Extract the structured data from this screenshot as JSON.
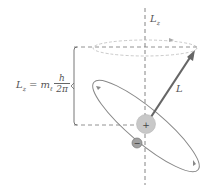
{
  "diagram": {
    "axis_label": "L",
    "axis_label_sub": "z",
    "vector_label": "L",
    "equation": {
      "lhs": "L",
      "lhs_sub": "z",
      "equals": "=",
      "coef": "m",
      "coef_sub": "ℓ",
      "numerator": "h",
      "denominator": "2π"
    },
    "nucleus_sign": "+",
    "electron_sign": "−",
    "colors": {
      "axis": "#777777",
      "vector": "#666666",
      "orbit": "#888888",
      "precession_cone": "#bbbbbb",
      "nucleus_fill": "#c8c8c8",
      "electron_fill": "#a0a0a0",
      "text": "#555555"
    }
  }
}
